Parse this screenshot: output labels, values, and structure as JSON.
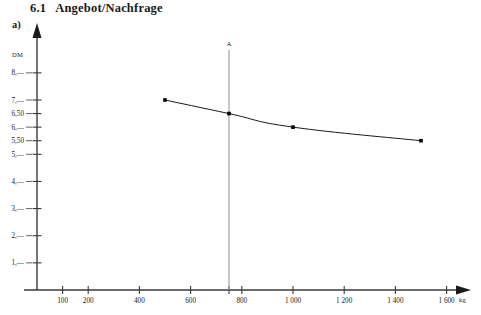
{
  "heading": {
    "number": "6.1",
    "title": "Angebot/Nachfrage"
  },
  "sublabel": "a)",
  "chart_data": {
    "type": "line",
    "title": "Angebot/Nachfrage",
    "xlabel": "kg",
    "ylabel": "DM",
    "x": [
      500,
      750,
      1000,
      1500
    ],
    "values": [
      7.0,
      6.5,
      6.0,
      5.5
    ],
    "series": [
      {
        "name": "Nachfragekurve",
        "points": [
          {
            "x": 500,
            "y": 7.0
          },
          {
            "x": 750,
            "y": 6.5
          },
          {
            "x": 1000,
            "y": 6.0
          },
          {
            "x": 1500,
            "y": 5.5
          }
        ]
      }
    ],
    "xlim": [
      0,
      1700
    ],
    "ylim": [
      0,
      8.6
    ],
    "grid": false,
    "legend": false,
    "xticks": [
      {
        "value": 100,
        "label": "100"
      },
      {
        "value": 200,
        "label": "200"
      },
      {
        "value": 400,
        "label": "400"
      },
      {
        "value": 600,
        "label": "600"
      },
      {
        "value": 750,
        "label": ""
      },
      {
        "value": 800,
        "label": "800"
      },
      {
        "value": 1000,
        "label": "1 000"
      },
      {
        "value": 1200,
        "label": "1 200"
      },
      {
        "value": 1400,
        "label": "1 400"
      },
      {
        "value": 1600,
        "label": "1 600"
      }
    ],
    "yticks": [
      {
        "value": 1.0,
        "label": "1,—"
      },
      {
        "value": 2.0,
        "label": "2,—"
      },
      {
        "value": 3.0,
        "label": "3,—"
      },
      {
        "value": 4.0,
        "label": "4,—"
      },
      {
        "value": 5.0,
        "label": "5,—"
      },
      {
        "value": 5.5,
        "label": "5,50"
      },
      {
        "value": 6.0,
        "label": "6,—"
      },
      {
        "value": 6.5,
        "label": "6,50"
      },
      {
        "value": 7.0,
        "label": "7,—"
      },
      {
        "value": 8.0,
        "label": "8,—"
      }
    ],
    "annotations": [
      {
        "name": "A",
        "label": "A",
        "type": "vertical-line",
        "x": 750,
        "intersect_y": 6.5
      }
    ],
    "axis_unit_x": "kg",
    "axis_unit_y": "DM"
  },
  "colors": {
    "curve": "#1a1a1a",
    "axis": "#3a3a3a",
    "vline": "#9a9a9a",
    "background": "#ffffff"
  }
}
